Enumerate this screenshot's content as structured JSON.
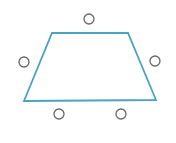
{
  "diagram": {
    "shape": "trapezoid",
    "stroke_color": "#4aa3c0",
    "stroke_width": 1.8,
    "vertices": [
      [
        52,
        33
      ],
      [
        128,
        33
      ],
      [
        156,
        100
      ],
      [
        24,
        101
      ]
    ],
    "markers": {
      "stroke_color": "#666666",
      "radius": 5,
      "items": [
        {
          "name": "top",
          "cx": 89,
          "cy": 19
        },
        {
          "name": "left",
          "cx": 24,
          "cy": 62
        },
        {
          "name": "right",
          "cx": 155,
          "cy": 61
        },
        {
          "name": "bottom-left",
          "cx": 59,
          "cy": 114
        },
        {
          "name": "bottom-right",
          "cx": 121,
          "cy": 114
        }
      ]
    }
  }
}
